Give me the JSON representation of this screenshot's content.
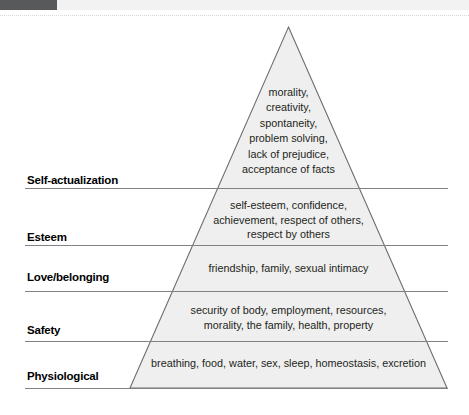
{
  "diagram": {
    "type": "pyramid",
    "fill_color": "#efefef",
    "stroke_color": "#6d6e71",
    "label_color": "#000000",
    "text_color": "#231f20",
    "top_bar_color": "#58595b",
    "tiers": [
      {
        "id": "self-actualization",
        "label": "Self-actualization",
        "level": 5,
        "content_lines": [
          "morality,",
          "creativity,",
          "spontaneity,",
          "problem solving,",
          "lack of prejudice,",
          "acceptance of facts"
        ],
        "content_text": "morality, creativity, spontaneity, problem solving, lack of prejudice, acceptance of facts"
      },
      {
        "id": "esteem",
        "label": "Esteem",
        "level": 4,
        "content_lines": [
          "self-esteem, confidence,",
          "achievement, respect of others,",
          "respect by others"
        ],
        "content_text": "self-esteem, confidence, achievement, respect of others, respect by others"
      },
      {
        "id": "love-belonging",
        "label": "Love/belonging",
        "level": 3,
        "content_lines": [
          "friendship, family, sexual intimacy"
        ],
        "content_text": "friendship, family, sexual intimacy"
      },
      {
        "id": "safety",
        "label": "Safety",
        "level": 2,
        "content_lines": [
          "security of body, employment, resources,",
          "morality, the family, health, property"
        ],
        "content_text": "security of body, employment, resources, morality, the family, health, property"
      },
      {
        "id": "physiological",
        "label": "Physiological",
        "level": 1,
        "content_lines": [
          "breathing, food, water, sex, sleep, homeostasis, excretion"
        ],
        "content_text": "breathing, food, water, sex, sleep, homeostasis, excretion"
      }
    ]
  }
}
